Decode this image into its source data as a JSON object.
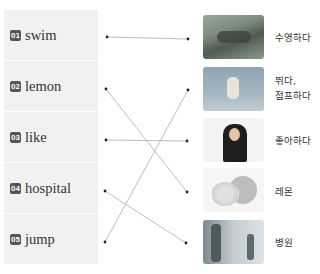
{
  "exercise": {
    "words": [
      {
        "number": "01",
        "text": "swim"
      },
      {
        "number": "02",
        "text": "lemon"
      },
      {
        "number": "03",
        "text": "like"
      },
      {
        "number": "04",
        "text": "hospital"
      },
      {
        "number": "05",
        "text": "jump"
      }
    ],
    "meanings": [
      {
        "image": "swimming-photo",
        "line1": "수영하다",
        "line2": ""
      },
      {
        "image": "jumping-photo",
        "line1": "뛰다,",
        "line2": "점프하다"
      },
      {
        "image": "thumbs-up-woman-photo",
        "line1": "좋아하다",
        "line2": ""
      },
      {
        "image": "lemon-photo",
        "line1": "레몬",
        "line2": ""
      },
      {
        "image": "hospital-photo",
        "line1": "병원",
        "line2": ""
      }
    ],
    "connections": [
      {
        "word": "swim",
        "meaning": "수영하다"
      },
      {
        "word": "lemon",
        "meaning": "레몬"
      },
      {
        "word": "like",
        "meaning": "좋아하다"
      },
      {
        "word": "hospital",
        "meaning": "병원"
      },
      {
        "word": "jump",
        "meaning": "뛰다, 점프하다"
      }
    ],
    "colors": {
      "box": "#f1f1f1",
      "badge": "#555555",
      "line": "#b5b5b5",
      "dot": "#222222"
    }
  }
}
